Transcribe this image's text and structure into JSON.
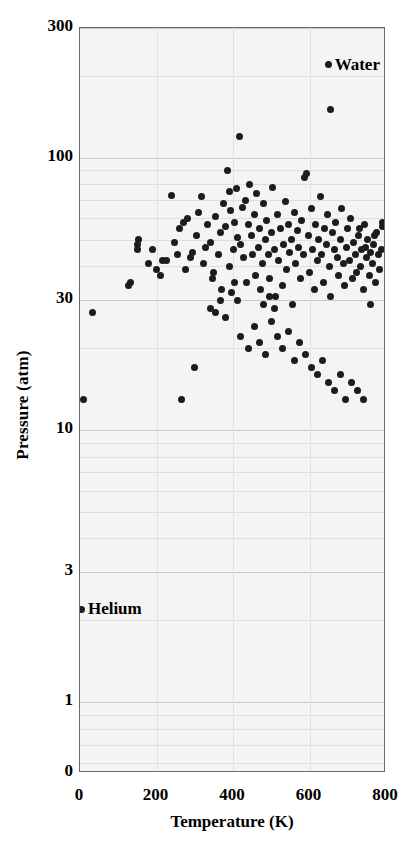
{
  "chart_data": {
    "type": "scatter",
    "title": "",
    "xlabel": "Temperature (K)",
    "ylabel": "Pressure (atm)",
    "xlim": [
      0,
      800
    ],
    "ylim": [
      0.55,
      300
    ],
    "yscale": "log",
    "xscale": "linear",
    "grid": true,
    "legend": "none",
    "xticks": [
      "0",
      "200",
      "400",
      "600",
      "800"
    ],
    "xtick_values": [
      0,
      200,
      400,
      600,
      800
    ],
    "yticks": [
      "0",
      "1",
      "3",
      "10",
      "30",
      "100",
      "300"
    ],
    "ytick_values": [
      0,
      1,
      3,
      10,
      30,
      100,
      300
    ],
    "annotations": [
      {
        "label": "Water",
        "x": 650,
        "y": 220
      },
      {
        "label": "Helium",
        "x": 5,
        "y": 2.2
      }
    ],
    "series": [
      {
        "name": "critical-points",
        "marker": "circle",
        "color": "#1c1c1c",
        "points": [
          [
            650,
            220
          ],
          [
            655,
            150
          ],
          [
            5,
            2.2
          ],
          [
            33,
            27
          ],
          [
            10,
            13
          ],
          [
            126,
            34
          ],
          [
            133,
            35
          ],
          [
            150,
            48
          ],
          [
            154,
            50
          ],
          [
            151,
            46
          ],
          [
            190,
            46
          ],
          [
            180,
            41
          ],
          [
            227,
            42
          ],
          [
            240,
            73
          ],
          [
            247,
            49
          ],
          [
            255,
            44
          ],
          [
            260,
            55
          ],
          [
            270,
            58
          ],
          [
            275,
            39
          ],
          [
            282,
            60
          ],
          [
            289,
            43
          ],
          [
            295,
            45
          ],
          [
            300,
            17
          ],
          [
            305,
            52
          ],
          [
            310,
            63
          ],
          [
            318,
            72
          ],
          [
            322,
            41
          ],
          [
            327,
            47
          ],
          [
            333,
            57
          ],
          [
            340,
            49
          ],
          [
            345,
            36
          ],
          [
            350,
            38
          ],
          [
            355,
            61
          ],
          [
            361,
            44
          ],
          [
            366,
            53
          ],
          [
            370,
            33
          ],
          [
            374,
            68
          ],
          [
            380,
            56
          ],
          [
            385,
            90
          ],
          [
            390,
            75
          ],
          [
            394,
            64
          ],
          [
            400,
            46
          ],
          [
            405,
            58
          ],
          [
            408,
            77
          ],
          [
            412,
            51
          ],
          [
            417,
            120
          ],
          [
            420,
            48
          ],
          [
            424,
            66
          ],
          [
            428,
            43
          ],
          [
            432,
            70
          ],
          [
            436,
            35
          ],
          [
            440,
            57
          ],
          [
            443,
            80
          ],
          [
            447,
            52
          ],
          [
            451,
            44
          ],
          [
            455,
            62
          ],
          [
            458,
            37
          ],
          [
            462,
            74
          ],
          [
            466,
            47
          ],
          [
            470,
            55
          ],
          [
            473,
            33
          ],
          [
            477,
            41
          ],
          [
            480,
            68
          ],
          [
            484,
            50
          ],
          [
            488,
            59
          ],
          [
            492,
            44
          ],
          [
            496,
            36
          ],
          [
            500,
            53
          ],
          [
            504,
            78
          ],
          [
            508,
            46
          ],
          [
            512,
            31
          ],
          [
            516,
            62
          ],
          [
            520,
            42
          ],
          [
            524,
            55
          ],
          [
            528,
            34
          ],
          [
            532,
            48
          ],
          [
            536,
            69
          ],
          [
            540,
            39
          ],
          [
            544,
            57
          ],
          [
            548,
            45
          ],
          [
            552,
            50
          ],
          [
            556,
            29
          ],
          [
            560,
            63
          ],
          [
            564,
            41
          ],
          [
            568,
            54
          ],
          [
            572,
            47
          ],
          [
            576,
            36
          ],
          [
            580,
            59
          ],
          [
            584,
            44
          ],
          [
            588,
            85
          ],
          [
            592,
            88
          ],
          [
            596,
            52
          ],
          [
            600,
            38
          ],
          [
            604,
            65
          ],
          [
            608,
            46
          ],
          [
            612,
            33
          ],
          [
            616,
            57
          ],
          [
            620,
            42
          ],
          [
            624,
            50
          ],
          [
            628,
            72
          ],
          [
            632,
            44
          ],
          [
            636,
            35
          ],
          [
            640,
            55
          ],
          [
            644,
            48
          ],
          [
            648,
            62
          ],
          [
            652,
            40
          ],
          [
            656,
            31
          ],
          [
            660,
            53
          ],
          [
            664,
            46
          ],
          [
            668,
            58
          ],
          [
            672,
            43
          ],
          [
            676,
            37
          ],
          [
            680,
            50
          ],
          [
            684,
            65
          ],
          [
            688,
            41
          ],
          [
            692,
            34
          ],
          [
            696,
            47
          ],
          [
            700,
            55
          ],
          [
            704,
            42
          ],
          [
            708,
            60
          ],
          [
            712,
            36
          ],
          [
            716,
            49
          ],
          [
            720,
            44
          ],
          [
            724,
            38
          ],
          [
            728,
            52
          ],
          [
            732,
            40
          ],
          [
            736,
            46
          ],
          [
            740,
            33
          ],
          [
            744,
            57
          ],
          [
            748,
            43
          ],
          [
            752,
            50
          ],
          [
            756,
            37
          ],
          [
            760,
            45
          ],
          [
            764,
            41
          ],
          [
            768,
            48
          ],
          [
            772,
            35
          ],
          [
            776,
            53
          ],
          [
            780,
            44
          ],
          [
            784,
            39
          ],
          [
            788,
            46
          ],
          [
            792,
            56
          ],
          [
            420,
            22
          ],
          [
            440,
            20
          ],
          [
            455,
            24
          ],
          [
            470,
            21
          ],
          [
            485,
            19
          ],
          [
            500,
            25
          ],
          [
            515,
            22
          ],
          [
            530,
            20
          ],
          [
            545,
            23
          ],
          [
            560,
            18
          ],
          [
            575,
            21
          ],
          [
            590,
            19
          ],
          [
            605,
            17
          ],
          [
            620,
            16
          ],
          [
            635,
            18
          ],
          [
            650,
            15
          ],
          [
            665,
            14
          ],
          [
            680,
            16
          ],
          [
            695,
            13
          ],
          [
            710,
            15
          ],
          [
            725,
            14
          ],
          [
            740,
            13
          ],
          [
            265,
            13
          ],
          [
            390,
            40
          ],
          [
            396,
            32
          ],
          [
            404,
            35
          ],
          [
            412,
            30
          ],
          [
            340,
            28
          ],
          [
            355,
            27
          ],
          [
            368,
            30
          ],
          [
            380,
            26
          ],
          [
            200,
            39
          ],
          [
            210,
            37
          ],
          [
            215,
            42
          ],
          [
            480,
            29
          ],
          [
            495,
            31
          ],
          [
            508,
            28
          ],
          [
            730,
            55
          ],
          [
            745,
            47
          ],
          [
            760,
            29
          ],
          [
            770,
            52
          ],
          [
            790,
            58
          ]
        ]
      }
    ]
  },
  "axes": {
    "plot_left_px": 79,
    "plot_top_px": 27,
    "plot_width_px": 306,
    "plot_height_px": 745
  }
}
